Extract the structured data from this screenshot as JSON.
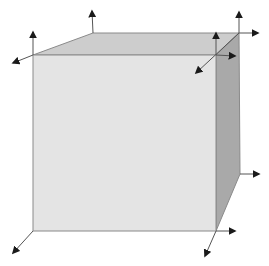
{
  "diagram": {
    "type": "cube-with-vertex-vectors",
    "colors": {
      "background": "#ffffff",
      "front_face": "#e4e4e4",
      "top_face": "#cdcdcd",
      "right_face": "#a9a9a9",
      "edge": "#8a8a8a",
      "arrow": "#1a1a1a"
    },
    "vertices": {
      "front_top_left": [
        33,
        55
      ],
      "front_top_right": [
        216,
        55
      ],
      "front_bottom_left": [
        33,
        231
      ],
      "front_bottom_right": [
        216,
        231
      ],
      "back_top_left": [
        93,
        33
      ],
      "back_top_right": [
        239,
        33
      ],
      "back_bottom_right": [
        240,
        174
      ]
    },
    "arrows": [
      {
        "name": "back-top-left-up",
        "from": [
          93,
          33
        ],
        "to": [
          92,
          11
        ]
      },
      {
        "name": "front-top-left-up",
        "from": [
          33,
          55
        ],
        "to": [
          33,
          32
        ]
      },
      {
        "name": "front-top-left-diagonal",
        "from": [
          33,
          55
        ],
        "to": [
          13,
          63
        ]
      },
      {
        "name": "back-top-right-up",
        "from": [
          239,
          33
        ],
        "to": [
          239,
          12
        ]
      },
      {
        "name": "back-top-right-right",
        "from": [
          239,
          33
        ],
        "to": [
          258,
          33
        ]
      },
      {
        "name": "back-top-right-diagonal",
        "from": [
          239,
          33
        ],
        "to": [
          196,
          73
        ]
      },
      {
        "name": "front-top-right-up",
        "from": [
          216,
          55
        ],
        "to": [
          216,
          33
        ]
      },
      {
        "name": "front-top-right-right",
        "from": [
          216,
          55
        ],
        "to": [
          235,
          56
        ]
      },
      {
        "name": "back-bottom-right-right",
        "from": [
          240,
          174
        ],
        "to": [
          259,
          174
        ]
      },
      {
        "name": "front-bottom-right-right",
        "from": [
          216,
          231
        ],
        "to": [
          235,
          231
        ]
      },
      {
        "name": "front-bottom-right-diagonal",
        "from": [
          216,
          231
        ],
        "to": [
          205,
          256
        ]
      },
      {
        "name": "front-bottom-left-diagonal",
        "from": [
          33,
          231
        ],
        "to": [
          13,
          253
        ]
      }
    ]
  }
}
